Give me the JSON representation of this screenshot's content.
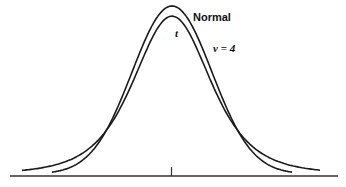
{
  "chart_data": {
    "type": "line",
    "title": "",
    "xlabel": "",
    "ylabel": "",
    "grid": false,
    "legend": "inline labels",
    "series": [
      {
        "name": "Normal",
        "label": "Normal",
        "distribution": "standard normal",
        "peak_density": 0.399
      },
      {
        "name": "t",
        "label": "t",
        "df_label": "ν = 4",
        "distribution": "Student t, 4 degrees of freedom",
        "peak_density": 0.375
      }
    ],
    "x_range": [
      -4,
      4
    ],
    "x_ticks": [
      0
    ],
    "annotations": [
      "Normal",
      "t",
      "ν = 4"
    ]
  },
  "labels": {
    "normal": "Normal",
    "t": "t",
    "nu": "ν = 4"
  },
  "colors": {
    "line": "#1a1a1a",
    "background": "#ffffff"
  }
}
